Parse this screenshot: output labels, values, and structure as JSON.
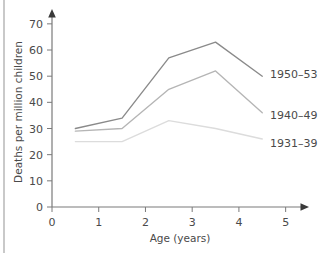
{
  "chart_data": {
    "type": "line",
    "title": "",
    "subtitle": "",
    "xlabel": "Age (years)",
    "ylabel": "Deaths per million children",
    "xlim": [
      0,
      5.35
    ],
    "ylim": [
      0,
      73
    ],
    "xticks": [
      "0",
      "1",
      "2",
      "3",
      "4",
      "5"
    ],
    "xtick_values": [
      0,
      1,
      2,
      3,
      4,
      5
    ],
    "yticks": [
      "0",
      "10",
      "20",
      "30",
      "40",
      "50",
      "60",
      "70"
    ],
    "ytick_values": [
      0,
      10,
      20,
      30,
      40,
      50,
      60,
      70
    ],
    "grid": false,
    "legend_position": "right-inline",
    "x": [
      0.5,
      1.5,
      2.5,
      3.5,
      4.5
    ],
    "series": [
      {
        "name": "1950–53",
        "label": "1950–53",
        "color": "#8a8a8a",
        "values": [
          30,
          34,
          57,
          63,
          50
        ]
      },
      {
        "name": "1940–49",
        "label": "1940–49",
        "color": "#b5b5b5",
        "values": [
          29,
          30,
          45,
          52,
          36
        ]
      },
      {
        "name": "1931–39",
        "label": "1931–39",
        "color": "#dcdcdc",
        "values": [
          25,
          25,
          33,
          30,
          26
        ]
      }
    ],
    "axis_color": "#7a7a7a",
    "text_color": "#4a4a4a"
  },
  "axes": {
    "y_axis_title": "Deaths per million children",
    "x_axis_title": "Age (years)"
  },
  "legend": {
    "entries": [
      {
        "label": "1950–53"
      },
      {
        "label": "1940–49"
      },
      {
        "label": "1931–39"
      }
    ]
  },
  "icons": {
    "x_arrow": "x-axis-arrow-icon",
    "y_arrow": "y-axis-arrow-icon"
  }
}
